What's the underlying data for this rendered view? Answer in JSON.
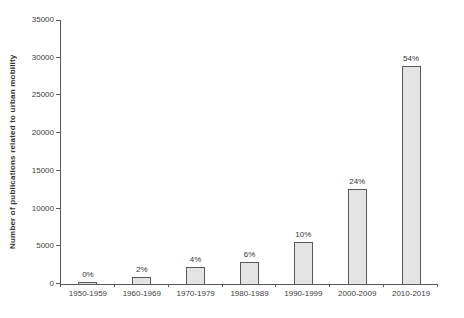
{
  "chart_data": {
    "type": "bar",
    "title": "",
    "xlabel": "",
    "ylabel": "Number of publications related to urban mobility",
    "categories": [
      "1950-1959",
      "1960-1969",
      "1970-1979",
      "1980-1989",
      "1990-1999",
      "2000-2009",
      "2010-2019"
    ],
    "values": [
      250,
      900,
      2250,
      2900,
      5600,
      12600,
      28900
    ],
    "bar_labels": [
      "0%",
      "2%",
      "4%",
      "6%",
      "10%",
      "24%",
      "54%"
    ],
    "ylim": [
      0,
      35000
    ],
    "ytick_step": 5000,
    "y_tick_labels": [
      "0",
      "5000",
      "10000",
      "15000",
      "20000",
      "25000",
      "30000",
      "35000"
    ],
    "grid": false,
    "legend": false,
    "colors": {
      "bar_fill": "#e4e4e4",
      "bar_border": "#595959",
      "axis": "#595959",
      "text": "#404040"
    }
  }
}
